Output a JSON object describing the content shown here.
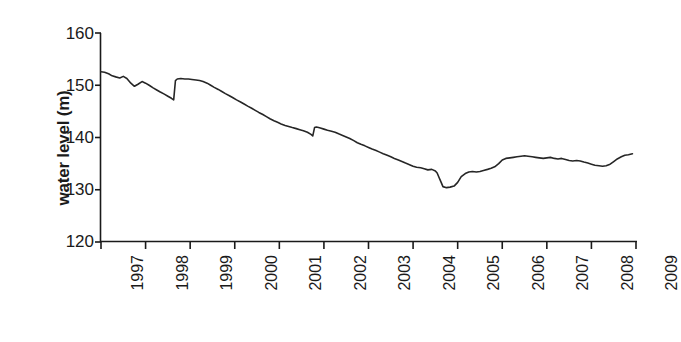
{
  "chart_data": {
    "type": "line",
    "title": "",
    "xlabel": "Date",
    "ylabel": "water level (m)",
    "xlim": [
      1997,
      2009
    ],
    "ylim": [
      120,
      160
    ],
    "y_ticks": [
      120,
      130,
      140,
      150,
      160
    ],
    "x_ticks": [
      1997,
      1998,
      1999,
      2000,
      2001,
      2002,
      2003,
      2004,
      2005,
      2006,
      2007,
      2008,
      2009
    ],
    "grid": false,
    "legend": false,
    "line_color": "#262626",
    "line_width": 1.6,
    "series": [
      {
        "name": "water level",
        "x": [
          1997.0,
          1997.08,
          1997.17,
          1997.25,
          1997.33,
          1997.42,
          1997.5,
          1997.58,
          1997.67,
          1997.75,
          1997.83,
          1997.92,
          1998.0,
          1998.08,
          1998.17,
          1998.25,
          1998.33,
          1998.42,
          1998.5,
          1998.58,
          1998.63,
          1998.67,
          1998.71,
          1998.79,
          1998.88,
          1998.96,
          1999.04,
          1999.13,
          1999.21,
          1999.29,
          1999.38,
          1999.46,
          1999.54,
          1999.63,
          1999.71,
          1999.79,
          1999.88,
          1999.96,
          2000.04,
          2000.13,
          2000.21,
          2000.29,
          2000.38,
          2000.46,
          2000.54,
          2000.63,
          2000.71,
          2000.79,
          2000.88,
          2000.96,
          2001.04,
          2001.13,
          2001.21,
          2001.29,
          2001.38,
          2001.46,
          2001.54,
          2001.63,
          2001.71,
          2001.75,
          2001.79,
          2001.83,
          2001.88,
          2001.92,
          2002.0,
          2002.08,
          2002.17,
          2002.25,
          2002.33,
          2002.42,
          2002.5,
          2002.58,
          2002.67,
          2002.75,
          2002.83,
          2002.92,
          2003.0,
          2003.08,
          2003.17,
          2003.25,
          2003.33,
          2003.42,
          2003.5,
          2003.58,
          2003.67,
          2003.75,
          2003.83,
          2003.92,
          2004.0,
          2004.08,
          2004.17,
          2004.25,
          2004.33,
          2004.42,
          2004.5,
          2004.54,
          2004.58,
          2004.63,
          2004.67,
          2004.75,
          2004.83,
          2004.92,
          2005.0,
          2005.08,
          2005.17,
          2005.25,
          2005.33,
          2005.42,
          2005.5,
          2005.58,
          2005.67,
          2005.75,
          2005.83,
          2005.92,
          2006.0,
          2006.08,
          2006.17,
          2006.25,
          2006.33,
          2006.42,
          2006.5,
          2006.58,
          2006.67,
          2006.75,
          2006.83,
          2006.92,
          2007.0,
          2007.08,
          2007.17,
          2007.25,
          2007.33,
          2007.42,
          2007.5,
          2007.58,
          2007.67,
          2007.75,
          2007.83,
          2007.92,
          2008.0,
          2008.08,
          2008.17,
          2008.25,
          2008.33,
          2008.42,
          2008.5,
          2008.58,
          2008.67,
          2008.75,
          2008.83,
          2008.92
        ],
        "y": [
          152.6,
          152.5,
          152.2,
          151.8,
          151.6,
          151.4,
          151.7,
          151.3,
          150.4,
          149.8,
          150.2,
          150.7,
          150.4,
          150.0,
          149.5,
          149.1,
          148.7,
          148.3,
          147.9,
          147.5,
          147.2,
          150.9,
          151.2,
          151.3,
          151.2,
          151.2,
          151.1,
          151.0,
          150.9,
          150.7,
          150.4,
          150.0,
          149.6,
          149.2,
          148.8,
          148.4,
          148.0,
          147.6,
          147.2,
          146.8,
          146.4,
          146.0,
          145.6,
          145.2,
          144.8,
          144.4,
          144.0,
          143.6,
          143.2,
          142.9,
          142.6,
          142.3,
          142.1,
          141.9,
          141.7,
          141.5,
          141.3,
          141.0,
          140.6,
          140.3,
          141.9,
          142.0,
          141.9,
          141.8,
          141.6,
          141.4,
          141.2,
          141.0,
          140.7,
          140.4,
          140.1,
          139.8,
          139.4,
          139.0,
          138.7,
          138.4,
          138.1,
          137.8,
          137.5,
          137.2,
          136.9,
          136.6,
          136.3,
          136.0,
          135.7,
          135.4,
          135.1,
          134.8,
          134.5,
          134.3,
          134.2,
          134.0,
          133.8,
          133.9,
          133.6,
          133.2,
          132.4,
          131.4,
          130.6,
          130.4,
          130.5,
          130.7,
          131.4,
          132.5,
          133.1,
          133.4,
          133.5,
          133.4,
          133.5,
          133.7,
          133.9,
          134.1,
          134.4,
          135.0,
          135.7,
          136.0,
          136.1,
          136.2,
          136.3,
          136.4,
          136.5,
          136.4,
          136.3,
          136.2,
          136.1,
          136.0,
          136.1,
          136.2,
          136.0,
          135.9,
          136.0,
          135.8,
          135.6,
          135.5,
          135.6,
          135.5,
          135.3,
          135.1,
          134.9,
          134.7,
          134.6,
          134.5,
          134.6,
          134.9,
          135.4,
          135.9,
          136.3,
          136.6,
          136.7,
          136.9
        ]
      }
    ],
    "annotations": [
      "sharp drop to ~147.2 in mid-1998 followed by abrupt recovery to ~151.3",
      "minimum ~130.4 around mid-2004",
      "partial recovery to ~136-137 from 2005 onward"
    ]
  },
  "axes": {
    "y_title": "water level (m)",
    "x_title": "Date",
    "y_tick_labels": [
      "160",
      "150",
      "140",
      "130",
      "120"
    ],
    "x_tick_labels": [
      "1997",
      "1998",
      "1999",
      "2000",
      "2001",
      "2002",
      "2003",
      "2004",
      "2005",
      "2006",
      "2007",
      "2008",
      "2009"
    ]
  }
}
